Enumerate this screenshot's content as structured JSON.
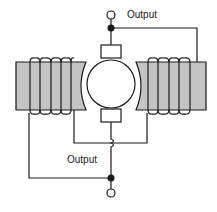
{
  "diagram": {
    "type": "dc-generator-compound-wound",
    "labels": {
      "top_output": "Output",
      "bottom_output": "Output"
    },
    "components": {
      "armature": "armature-rotor",
      "top_brush": "brush-top",
      "bottom_brush": "brush-bottom",
      "left_field_coil": "field-coil-left",
      "right_field_coil": "field-coil-right",
      "top_terminal": "output-terminal-top",
      "bottom_terminal": "output-terminal-bottom"
    },
    "colors": {
      "pole_fill": "#c4c4c4",
      "line": "#1a1a1a",
      "background": "#ffffff"
    },
    "left_coil_turns": 5,
    "right_coil_turns": 5
  }
}
